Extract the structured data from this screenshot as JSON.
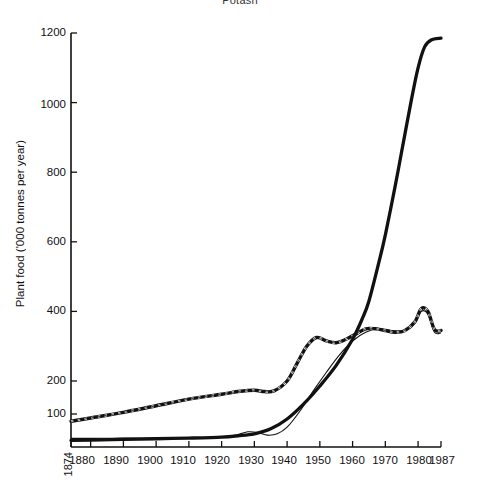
{
  "chart_data": {
    "type": "line",
    "title": "Potash",
    "title_note": "partially cropped at top edge of image",
    "xlabel": "",
    "ylabel": "Plant food ('000 tonnes per year)",
    "xlim": [
      1874,
      1987
    ],
    "ylim": [
      0,
      1200
    ],
    "grid": false,
    "legend": "none",
    "x_tick_labels": [
      "1874",
      "1880",
      "1890",
      "1900",
      "1910",
      "1920",
      "1930",
      "1940",
      "1950",
      "1960",
      "1970",
      "1980",
      "1987"
    ],
    "x_tick_values": [
      1874,
      1880,
      1890,
      1900,
      1910,
      1920,
      1930,
      1940,
      1950,
      1960,
      1970,
      1980,
      1987
    ],
    "y_tick_labels": [
      "100",
      "200",
      "400",
      "600",
      "800",
      "1000",
      "1200"
    ],
    "y_tick_values": [
      100,
      200,
      400,
      600,
      800,
      1000,
      1200
    ],
    "y_axis_note": "axis is broken/compressed between 0 and 200; 200-1200 is linear",
    "series": [
      {
        "name": "thick-solid-line",
        "style": "thick solid black",
        "x": [
          1874,
          1880,
          1890,
          1900,
          1910,
          1920,
          1925,
          1930,
          1935,
          1940,
          1945,
          1950,
          1955,
          1960,
          1963,
          1965,
          1968,
          1970,
          1973,
          1975,
          1978,
          1980,
          1982,
          1984,
          1987
        ],
        "values": [
          20,
          21,
          23,
          25,
          27,
          30,
          34,
          40,
          55,
          85,
          130,
          185,
          245,
          320,
          380,
          430,
          540,
          620,
          760,
          860,
          1010,
          1100,
          1160,
          1180,
          1185
        ]
      },
      {
        "name": "dashed-line",
        "style": "thick black with white dashes",
        "x": [
          1874,
          1880,
          1890,
          1900,
          1910,
          1920,
          1925,
          1930,
          1933,
          1936,
          1940,
          1943,
          1946,
          1949,
          1952,
          1955,
          1958,
          1961,
          1964,
          1967,
          1970,
          1973,
          1976,
          1979,
          1981,
          1983,
          1985,
          1987
        ],
        "values": [
          78,
          88,
          105,
          125,
          145,
          160,
          168,
          172,
          168,
          170,
          200,
          250,
          300,
          325,
          315,
          310,
          320,
          335,
          350,
          350,
          345,
          340,
          345,
          370,
          408,
          400,
          348,
          345
        ]
      },
      {
        "name": "thin-line",
        "style": "thin solid black",
        "x": [
          1874,
          1880,
          1890,
          1900,
          1910,
          1920,
          1925,
          1928,
          1931,
          1934,
          1937,
          1940,
          1944,
          1948,
          1952,
          1956,
          1960,
          1964,
          1968,
          1972,
          1976,
          1979,
          1981,
          1983,
          1985,
          1987
        ],
        "values": [
          26,
          26,
          27,
          27,
          28,
          30,
          38,
          46,
          44,
          36,
          40,
          60,
          110,
          170,
          225,
          275,
          315,
          340,
          350,
          345,
          345,
          365,
          400,
          392,
          340,
          338
        ]
      }
    ]
  },
  "axis": {
    "y_title": "Plant food ('000 tonnes per year)"
  }
}
